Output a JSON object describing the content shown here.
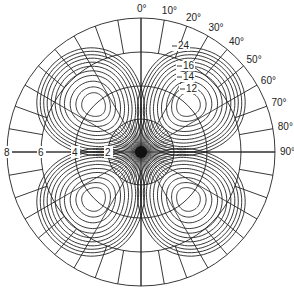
{
  "diagram": {
    "type": "polar-contour-plot",
    "center": [
      141,
      152
    ],
    "outer_radius": 134,
    "colors": {
      "line": "#222222",
      "background": "#ffffff"
    },
    "rings": [
      {
        "value": 2,
        "label": "2"
      },
      {
        "value": 4,
        "label": "4"
      },
      {
        "value": 6,
        "label": "6"
      },
      {
        "value": 8,
        "label": "8"
      }
    ],
    "angle_labels": [
      {
        "deg": 0,
        "label": "0°"
      },
      {
        "deg": 10,
        "label": "10°"
      },
      {
        "deg": 20,
        "label": "20°"
      },
      {
        "deg": 30,
        "label": "30°"
      },
      {
        "deg": 40,
        "label": "40°"
      },
      {
        "deg": 50,
        "label": "50°"
      },
      {
        "deg": 60,
        "label": "60°"
      },
      {
        "deg": 70,
        "label": "70°"
      },
      {
        "deg": 80,
        "label": "80°"
      },
      {
        "deg": 90,
        "label": "90°"
      }
    ],
    "contour_labels": [
      {
        "value": "24",
        "label": "24"
      },
      {
        "value": "16",
        "label": "16"
      },
      {
        "value": "14",
        "label": "14"
      },
      {
        "value": "12",
        "label": "12"
      }
    ],
    "lobes": [
      {
        "quadrant": "upper-left",
        "center_angle_deg": -45
      },
      {
        "quadrant": "upper-right",
        "center_angle_deg": 45
      },
      {
        "quadrant": "lower-left",
        "center_angle_deg": -135
      },
      {
        "quadrant": "lower-right",
        "center_angle_deg": 135
      }
    ]
  }
}
